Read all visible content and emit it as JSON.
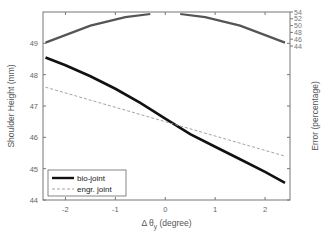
{
  "chart_data": {
    "type": "line",
    "title": "",
    "xlabel": "Δ θ_y (degree)",
    "ylabel": "Shoulder Height (mm)",
    "ylabel_right": "Error (percentage)",
    "xlim": [
      -2.45,
      2.5
    ],
    "ylim": [
      44,
      50
    ],
    "ylim_right": [
      44,
      54
    ],
    "xticks": [
      "-2",
      "-1",
      "0",
      "1",
      "2"
    ],
    "yticks": [
      "44",
      "45",
      "46",
      "47",
      "48",
      "49"
    ],
    "yticks_right": [
      "44",
      "46",
      "48",
      "50",
      "52",
      "54"
    ],
    "grid": false,
    "legend_position": "lower left",
    "series": [
      {
        "name": "bio-joint",
        "axis": "left",
        "style": "solid-thick",
        "color": "#111111",
        "x": [
          -2.4,
          -2.0,
          -1.5,
          -1.0,
          -0.5,
          0.0,
          0.5,
          1.0,
          1.5,
          2.0,
          2.4
        ],
        "values": [
          48.55,
          48.3,
          47.95,
          47.55,
          47.1,
          46.6,
          46.1,
          45.7,
          45.3,
          44.9,
          44.55
        ]
      },
      {
        "name": "engr. joint",
        "axis": "left",
        "style": "dashed",
        "color": "#999999",
        "x": [
          -2.4,
          2.4
        ],
        "values": [
          47.6,
          45.4
        ]
      },
      {
        "name": "error",
        "axis": "right",
        "style": "solid",
        "color": "#555555",
        "x": [
          -2.4,
          -1.5,
          -0.8,
          -0.3,
          0.3,
          0.8,
          1.5,
          2.4
        ],
        "values": [
          45.0,
          50.0,
          52.5,
          53.5,
          53.5,
          52.5,
          50.0,
          45.0
        ]
      }
    ]
  },
  "legend": {
    "items": [
      "bio-joint",
      "engr. joint"
    ]
  },
  "axes": {
    "xlabel_prefix": "Δ θ",
    "xlabel_sub": "y",
    "xlabel_suffix": " (degree)"
  }
}
